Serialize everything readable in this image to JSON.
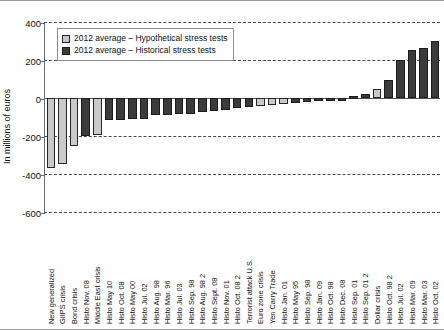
{
  "chart_data": {
    "type": "bar",
    "title": "",
    "subtitle": "",
    "xlabel": "",
    "ylabel": "In millions of euros",
    "ylim": [
      -600,
      400
    ],
    "yticks": [
      400,
      200,
      0,
      -200,
      -400,
      -600
    ],
    "grid": true,
    "legend_position": "top-left",
    "legend": [
      "2012 average – Hypothetical stress tests",
      "2012 average – Historical stress tests"
    ],
    "series_colors": {
      "hypothetical": "#c9c9c9",
      "historical": "#3b3b3b"
    },
    "categories": [
      "New generalized",
      "GIIPS crisis",
      "Bond crisis",
      "Histo Nov. 08",
      "Middle East crisis",
      "Histo May 10",
      "Histo Oct. 08",
      "Histo May 00",
      "Histo Jul. 02",
      "Histo Aug. 98",
      "Histo Mar. 96",
      "Histo Jul. 03",
      "Histo Sep. 98",
      "Histo Aug. 98 2",
      "Histo Sept. 08",
      "Histo Nov. 01",
      "Histo Oct. 08 2",
      "Terrorist attack U.S.",
      "Euro zone crisis",
      "Yen Carry Trade",
      "Histo Jan. 01",
      "Histo May 95",
      "Histo Sep. 98",
      "Histo Jan. 09",
      "Histo Oct. 98",
      "Histo Dec. 08",
      "Histo Sep. 01",
      "Histo Sep. 01 2",
      "Dollar crisis",
      "Histo Oct. 98 2",
      "Histo Jul. 02",
      "Histo Mar. 09",
      "Histo Mar. 03",
      "Histo Oct. 02"
    ],
    "values": [
      -370,
      -345,
      -255,
      -200,
      -195,
      -118,
      -115,
      -112,
      -108,
      -92,
      -88,
      -85,
      -82,
      -75,
      -70,
      -62,
      -55,
      -48,
      -42,
      -38,
      -32,
      -28,
      -22,
      -16,
      -10,
      -6,
      8,
      22,
      48,
      95,
      200,
      255,
      265,
      300
    ],
    "bar_types": [
      "hypothetical",
      "hypothetical",
      "hypothetical",
      "historical",
      "hypothetical",
      "historical",
      "historical",
      "historical",
      "historical",
      "historical",
      "historical",
      "historical",
      "historical",
      "historical",
      "historical",
      "historical",
      "historical",
      "historical",
      "hypothetical",
      "hypothetical",
      "hypothetical",
      "historical",
      "historical",
      "historical",
      "historical",
      "historical",
      "historical",
      "historical",
      "hypothetical",
      "historical",
      "historical",
      "historical",
      "historical",
      "historical"
    ]
  }
}
